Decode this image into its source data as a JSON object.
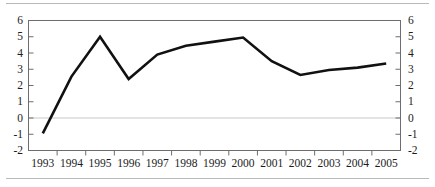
{
  "chart_data": {
    "type": "line",
    "title": "",
    "subtitle": "",
    "xlabel": "",
    "ylabel": "",
    "categories": [
      "1993",
      "1994",
      "1995",
      "1996",
      "1997",
      "1998",
      "1999",
      "2000",
      "2001",
      "2002",
      "2003",
      "2004",
      "2005"
    ],
    "x": [
      1993,
      1994,
      1995,
      1996,
      1997,
      1998,
      1999,
      2000,
      2001,
      2002,
      2003,
      2004,
      2005
    ],
    "values": [
      -0.95,
      2.55,
      5.0,
      2.4,
      3.9,
      4.45,
      4.7,
      4.95,
      3.5,
      2.65,
      2.95,
      3.1,
      3.35
    ],
    "series": [
      {
        "name": "",
        "values": [
          -0.95,
          2.55,
          5.0,
          2.4,
          3.9,
          4.45,
          4.7,
          4.95,
          3.5,
          2.65,
          2.95,
          3.1,
          3.35
        ],
        "color": "#111111"
      }
    ],
    "ylim": [
      -2,
      6
    ],
    "yticks": [
      6,
      5,
      4,
      3,
      2,
      1,
      0,
      -1,
      -2
    ],
    "ytick_labels_left": [
      "6",
      "5",
      "4",
      "3",
      "2",
      "1",
      "0",
      "-1",
      "-2"
    ],
    "ytick_labels_right": [
      "6",
      "5",
      "4",
      "3",
      "2",
      "1",
      "0",
      "-1",
      "-2"
    ],
    "grid": "zero-line-only",
    "gridlines_y": [
      0
    ],
    "legend": "none",
    "legend_position": "none",
    "annotations": [],
    "dual_axis": true,
    "line_width": 2.6,
    "markers": "none"
  },
  "colors": {
    "line": "#111111",
    "axis": "#6d6d6d",
    "zero_gridline": "#c9c9c9",
    "text": "#1c1c1c",
    "rule": "#b9b9b9",
    "background": "#ffffff"
  }
}
